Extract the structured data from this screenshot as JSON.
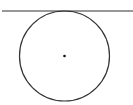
{
  "diagram": {
    "stroke_color": "#333333",
    "tangent_line": {
      "x1": 2,
      "y1": 11,
      "x2": 133,
      "y2": 11
    },
    "circle": {
      "cx": 64.5,
      "cy": 56,
      "r": 45
    },
    "center_point": {
      "cx": 64.5,
      "cy": 56,
      "r": 1.3
    }
  }
}
